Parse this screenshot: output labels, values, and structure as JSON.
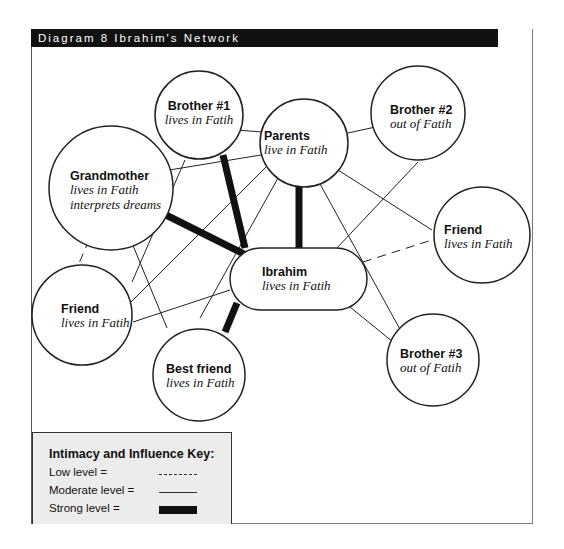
{
  "title": "Diagram 8 Ibrahim's Network",
  "nodes": {
    "brother1": {
      "name": "Brother #1",
      "sub": "lives in Fatih"
    },
    "parents": {
      "name": "Parents",
      "sub": "live in Fatih"
    },
    "brother2": {
      "name": "Brother #2",
      "sub": "out of Fatih"
    },
    "grandmother": {
      "name": "Grandmother",
      "sub1": "lives in Fatih",
      "sub2": "interprets dreams"
    },
    "friend_right": {
      "name": "Friend",
      "sub": "lives in Fatih"
    },
    "ibrahim": {
      "name": "Ibrahim",
      "sub": "lives in Fatih"
    },
    "friend_left": {
      "name": "Friend",
      "sub": "lives in Fatih"
    },
    "best_friend": {
      "name": "Best friend",
      "sub": "lives in Fatih"
    },
    "brother3": {
      "name": "Brother #3",
      "sub": "out of Fatih"
    }
  },
  "connections": [
    {
      "from": "Ibrahim",
      "to": "Brother #1",
      "level": "strong"
    },
    {
      "from": "Ibrahim",
      "to": "Parents",
      "level": "strong"
    },
    {
      "from": "Ibrahim",
      "to": "Grandmother",
      "level": "strong"
    },
    {
      "from": "Ibrahim",
      "to": "Best friend",
      "level": "strong"
    },
    {
      "from": "Ibrahim",
      "to": "Friend (right)",
      "level": "low"
    },
    {
      "from": "Ibrahim",
      "to": "Brother #2",
      "level": "moderate"
    },
    {
      "from": "Ibrahim",
      "to": "Brother #3",
      "level": "moderate"
    },
    {
      "from": "Ibrahim",
      "to": "Friend (left)",
      "level": "moderate"
    },
    {
      "from": "Parents",
      "to": "Brother #1",
      "level": "moderate"
    },
    {
      "from": "Parents",
      "to": "Brother #2",
      "level": "moderate"
    },
    {
      "from": "Parents",
      "to": "Grandmother",
      "level": "moderate"
    },
    {
      "from": "Parents",
      "to": "Friend (right)",
      "level": "moderate"
    },
    {
      "from": "Parents",
      "to": "Brother #3",
      "level": "moderate"
    },
    {
      "from": "Parents",
      "to": "Friend (left)",
      "level": "moderate"
    },
    {
      "from": "Parents",
      "to": "Best friend",
      "level": "moderate"
    },
    {
      "from": "Brother #1",
      "to": "Friend (left)",
      "level": "moderate"
    },
    {
      "from": "Grandmother",
      "to": "Best friend",
      "level": "moderate"
    },
    {
      "from": "Grandmother",
      "to": "Friend (left)",
      "level": "low"
    }
  ],
  "key": {
    "title": "Intimacy and Influence Key:",
    "low_label": "Low level =",
    "moderate_label": "Moderate level =",
    "strong_label": "Strong level ="
  },
  "colors": {
    "line": "#222222",
    "title_bar": "#111111",
    "key_bg": "#ececec"
  }
}
